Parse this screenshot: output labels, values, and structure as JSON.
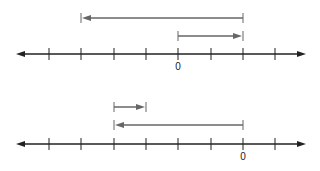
{
  "diagrams": [
    {
      "name": "number-line-1",
      "axis_y": 54,
      "zero_label": "0",
      "zero_x": 178,
      "tick_xs": [
        49,
        81,
        114,
        146,
        178,
        211,
        243,
        275
      ],
      "arrows": [
        {
          "name": "long-left-arrow",
          "y": 18,
          "from_x": 243,
          "to_x": 81,
          "direction": "left"
        },
        {
          "name": "short-right-arrow",
          "y": 36,
          "from_x": 178,
          "to_x": 243,
          "direction": "right"
        }
      ]
    },
    {
      "name": "number-line-2",
      "axis_y": 144,
      "zero_label": "0",
      "zero_x": 243,
      "tick_xs": [
        49,
        81,
        114,
        146,
        178,
        211,
        243,
        275
      ],
      "arrows": [
        {
          "name": "short-right-arrow",
          "y": 107,
          "from_x": 114,
          "to_x": 146,
          "direction": "right"
        },
        {
          "name": "long-left-arrow",
          "y": 125,
          "from_x": 243,
          "to_x": 114,
          "direction": "left"
        }
      ]
    }
  ],
  "colors": {
    "axis": "#222222",
    "arrow": "#666666"
  }
}
